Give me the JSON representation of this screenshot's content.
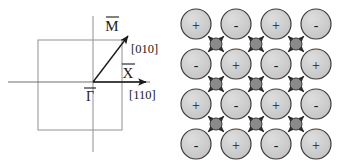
{
  "figure": {
    "panels": [
      "brillouin-zone",
      "charge-ordered-lattice"
    ],
    "background": "#ffffff"
  },
  "brillouin_zone": {
    "colors": {
      "square_stroke": "#8f8f8f",
      "axis_stroke": "#6e6e6e",
      "arrow_stroke": "#1a1a1a",
      "text": "#1a1a1a"
    },
    "square": {
      "x": 38,
      "y": 40,
      "width": 84,
      "height": 90
    },
    "origin": {
      "x": 93,
      "y": 82
    },
    "axes": {
      "horizontal": {
        "x1": 8,
        "y1": 82,
        "x2": 152,
        "y2": 82
      },
      "vertical": {
        "x1": 93,
        "y1": 16,
        "x2": 93,
        "y2": 152
      }
    },
    "symmetry_points": [
      {
        "name": "gamma-bar",
        "label": "Γ",
        "overbar": true,
        "x": 89,
        "y": 100
      },
      {
        "name": "x-bar",
        "label": "X",
        "overbar": true,
        "x": 128,
        "y": 76
      },
      {
        "name": "m-bar",
        "label": "M",
        "overbar": true,
        "x": 112,
        "y": 28
      }
    ],
    "direction_labels": [
      {
        "name": "direction-010",
        "label": "[010]",
        "x": 130,
        "y": 50
      },
      {
        "name": "direction-110",
        "label": "[110]",
        "x": 128,
        "y": 96
      }
    ],
    "arrows": [
      {
        "name": "arrow-gamma-to-x",
        "x1": 93,
        "y1": 82,
        "x2": 150,
        "y2": 82
      },
      {
        "name": "arrow-gamma-to-m",
        "x1": 93,
        "y1": 82,
        "x2": 131,
        "y2": 32
      }
    ]
  },
  "lattice": {
    "colors": {
      "large_circle_fill": "#cccccc",
      "large_circle_stroke": "#3a3a3a",
      "small_circle_fill": "#8a8a8a",
      "small_circle_stroke": "#3a3a3a",
      "arrow_stroke": "#2a2a2a",
      "sign_text": "#1a1a1a"
    },
    "geometry": {
      "origin_x": 24,
      "origin_y": 24,
      "spacing": 40,
      "large_radius": 15,
      "small_radius": 6,
      "rows": 4,
      "cols": 4
    },
    "ion_rows": [
      [
        "+",
        "-",
        "+",
        "-"
      ],
      [
        "-",
        "+",
        "-",
        "+"
      ],
      [
        "+",
        "-",
        "+",
        "-"
      ],
      [
        "-",
        "+",
        "-",
        "+"
      ]
    ],
    "interstitial_rows": 3,
    "interstitial_cols": 3,
    "arrow_directions": [
      "up-left",
      "up-right",
      "down-left",
      "down-right"
    ]
  }
}
